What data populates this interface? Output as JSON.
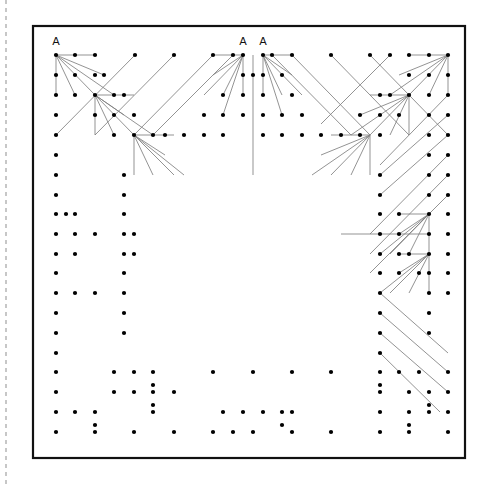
{
  "page": {
    "width": 498,
    "height": 484,
    "background": "#ffffff"
  },
  "colors": {
    "frame_stroke": "#111111",
    "dot_fill": "#000000",
    "connector_stroke": "#808080",
    "margin_line_stroke": "#9a9a9a",
    "label_fill": "#111111"
  },
  "frame": {
    "x": 33,
    "y": 26,
    "width": 432,
    "height": 432,
    "stroke_width": 2.2
  },
  "margin_line": {
    "x": 6,
    "y1": 0,
    "y2": 484,
    "dash": "4 4",
    "stroke_width": 1.1
  },
  "grid": {
    "origin_x": 56,
    "origin_y": 55,
    "step_x": 19.6,
    "step_y": 19.6,
    "cols": 21,
    "rows": 20,
    "dot_radius": 2.1
  },
  "labels": [
    {
      "text": "A",
      "x": 56,
      "y": 45,
      "name": "label-a-left"
    },
    {
      "text": "A",
      "x": 243,
      "y": 45,
      "name": "label-a-center-left"
    },
    {
      "text": "A",
      "x": 263,
      "y": 45,
      "name": "label-a-center-right"
    }
  ],
  "dots": [
    [
      56,
      55
    ],
    [
      75,
      55
    ],
    [
      95,
      55
    ],
    [
      135,
      55
    ],
    [
      174,
      55
    ],
    [
      213,
      55
    ],
    [
      233,
      55
    ],
    [
      243,
      55
    ],
    [
      263,
      55
    ],
    [
      272,
      55
    ],
    [
      292,
      55
    ],
    [
      331,
      55
    ],
    [
      370,
      55
    ],
    [
      390,
      55
    ],
    [
      409,
      55
    ],
    [
      429,
      55
    ],
    [
      448,
      55
    ],
    [
      56,
      75
    ],
    [
      75,
      75
    ],
    [
      95,
      75
    ],
    [
      104,
      75
    ],
    [
      243,
      75
    ],
    [
      253,
      75
    ],
    [
      263,
      75
    ],
    [
      282,
      75
    ],
    [
      409,
      75
    ],
    [
      429,
      75
    ],
    [
      448,
      75
    ],
    [
      56,
      95
    ],
    [
      75,
      95
    ],
    [
      95,
      95
    ],
    [
      114,
      95
    ],
    [
      124,
      95
    ],
    [
      223,
      95
    ],
    [
      243,
      95
    ],
    [
      263,
      95
    ],
    [
      292,
      95
    ],
    [
      380,
      95
    ],
    [
      390,
      95
    ],
    [
      409,
      95
    ],
    [
      429,
      95
    ],
    [
      448,
      95
    ],
    [
      56,
      115
    ],
    [
      95,
      115
    ],
    [
      114,
      115
    ],
    [
      134,
      115
    ],
    [
      204,
      115
    ],
    [
      223,
      115
    ],
    [
      243,
      115
    ],
    [
      263,
      115
    ],
    [
      282,
      115
    ],
    [
      302,
      115
    ],
    [
      360,
      115
    ],
    [
      380,
      115
    ],
    [
      399,
      115
    ],
    [
      429,
      115
    ],
    [
      448,
      115
    ],
    [
      56,
      135
    ],
    [
      114,
      135
    ],
    [
      134,
      135
    ],
    [
      153,
      135
    ],
    [
      165,
      135
    ],
    [
      184,
      135
    ],
    [
      204,
      135
    ],
    [
      223,
      135
    ],
    [
      263,
      135
    ],
    [
      282,
      135
    ],
    [
      302,
      135
    ],
    [
      321,
      135
    ],
    [
      341,
      135
    ],
    [
      360,
      135
    ],
    [
      380,
      135
    ],
    [
      429,
      135
    ],
    [
      448,
      135
    ],
    [
      56,
      155
    ],
    [
      429,
      155
    ],
    [
      448,
      155
    ],
    [
      56,
      175
    ],
    [
      124,
      175
    ],
    [
      380,
      175
    ],
    [
      429,
      175
    ],
    [
      448,
      175
    ],
    [
      56,
      195
    ],
    [
      124,
      195
    ],
    [
      380,
      195
    ],
    [
      429,
      195
    ],
    [
      448,
      195
    ],
    [
      56,
      214
    ],
    [
      66,
      214
    ],
    [
      75,
      214
    ],
    [
      124,
      214
    ],
    [
      380,
      214
    ],
    [
      399,
      214
    ],
    [
      429,
      214
    ],
    [
      448,
      214
    ],
    [
      56,
      234
    ],
    [
      75,
      234
    ],
    [
      95,
      234
    ],
    [
      124,
      234
    ],
    [
      134,
      234
    ],
    [
      380,
      234
    ],
    [
      399,
      234
    ],
    [
      429,
      234
    ],
    [
      448,
      234
    ],
    [
      56,
      254
    ],
    [
      75,
      254
    ],
    [
      124,
      254
    ],
    [
      134,
      254
    ],
    [
      380,
      254
    ],
    [
      399,
      254
    ],
    [
      409,
      254
    ],
    [
      429,
      254
    ],
    [
      448,
      254
    ],
    [
      56,
      273
    ],
    [
      124,
      273
    ],
    [
      380,
      273
    ],
    [
      399,
      273
    ],
    [
      419,
      273
    ],
    [
      429,
      273
    ],
    [
      448,
      273
    ],
    [
      56,
      293
    ],
    [
      75,
      293
    ],
    [
      95,
      293
    ],
    [
      124,
      293
    ],
    [
      380,
      293
    ],
    [
      429,
      293
    ],
    [
      448,
      293
    ],
    [
      56,
      313
    ],
    [
      124,
      313
    ],
    [
      380,
      313
    ],
    [
      429,
      313
    ],
    [
      56,
      333
    ],
    [
      124,
      333
    ],
    [
      380,
      333
    ],
    [
      429,
      333
    ],
    [
      56,
      353
    ],
    [
      380,
      353
    ],
    [
      56,
      372
    ],
    [
      114,
      372
    ],
    [
      134,
      372
    ],
    [
      153,
      372
    ],
    [
      213,
      372
    ],
    [
      253,
      372
    ],
    [
      292,
      372
    ],
    [
      331,
      372
    ],
    [
      380,
      372
    ],
    [
      399,
      372
    ],
    [
      419,
      372
    ],
    [
      448,
      372
    ],
    [
      153,
      385
    ],
    [
      380,
      385
    ],
    [
      56,
      392
    ],
    [
      114,
      392
    ],
    [
      134,
      392
    ],
    [
      153,
      392
    ],
    [
      174,
      392
    ],
    [
      380,
      392
    ],
    [
      409,
      392
    ],
    [
      429,
      392
    ],
    [
      448,
      392
    ],
    [
      153,
      405
    ],
    [
      429,
      405
    ],
    [
      56,
      412
    ],
    [
      75,
      412
    ],
    [
      95,
      412
    ],
    [
      153,
      412
    ],
    [
      223,
      412
    ],
    [
      243,
      412
    ],
    [
      263,
      412
    ],
    [
      282,
      412
    ],
    [
      292,
      412
    ],
    [
      380,
      412
    ],
    [
      409,
      412
    ],
    [
      429,
      412
    ],
    [
      448,
      412
    ],
    [
      95,
      425
    ],
    [
      282,
      425
    ],
    [
      409,
      425
    ],
    [
      56,
      432
    ],
    [
      95,
      432
    ],
    [
      134,
      432
    ],
    [
      174,
      432
    ],
    [
      213,
      432
    ],
    [
      233,
      432
    ],
    [
      253,
      432
    ],
    [
      292,
      432
    ],
    [
      331,
      432
    ],
    [
      380,
      432
    ],
    [
      409,
      432
    ],
    [
      448,
      432
    ]
  ],
  "connectors": [
    {
      "from": [
        56,
        55
      ],
      "to": [
        95,
        55
      ]
    },
    {
      "from": [
        56,
        55
      ],
      "to": [
        56,
        95
      ]
    },
    {
      "from": [
        56,
        55
      ],
      "to": [
        75,
        95
      ]
    },
    {
      "from": [
        56,
        55
      ],
      "to": [
        95,
        95
      ]
    },
    {
      "from": [
        56,
        55
      ],
      "to": [
        104,
        75
      ]
    },
    {
      "from": [
        56,
        55
      ],
      "to": [
        114,
        95
      ]
    },
    {
      "from": [
        95,
        95
      ],
      "to": [
        134,
        95
      ]
    },
    {
      "from": [
        95,
        95
      ],
      "to": [
        95,
        135
      ]
    },
    {
      "from": [
        95,
        95
      ],
      "to": [
        114,
        135
      ]
    },
    {
      "from": [
        95,
        95
      ],
      "to": [
        134,
        135
      ]
    },
    {
      "from": [
        95,
        95
      ],
      "to": [
        124,
        115
      ]
    },
    {
      "from": [
        95,
        95
      ],
      "to": [
        153,
        135
      ]
    },
    {
      "from": [
        134,
        135
      ],
      "to": [
        174,
        135
      ]
    },
    {
      "from": [
        134,
        135
      ],
      "to": [
        134,
        175
      ]
    },
    {
      "from": [
        134,
        135
      ],
      "to": [
        153,
        175
      ]
    },
    {
      "from": [
        134,
        135
      ],
      "to": [
        174,
        175
      ]
    },
    {
      "from": [
        134,
        135
      ],
      "to": [
        165,
        155
      ]
    },
    {
      "from": [
        134,
        135
      ],
      "to": [
        184,
        175
      ]
    },
    {
      "from": [
        448,
        55
      ],
      "to": [
        409,
        55
      ]
    },
    {
      "from": [
        448,
        55
      ],
      "to": [
        448,
        95
      ]
    },
    {
      "from": [
        448,
        55
      ],
      "to": [
        429,
        95
      ]
    },
    {
      "from": [
        448,
        55
      ],
      "to": [
        409,
        95
      ]
    },
    {
      "from": [
        448,
        55
      ],
      "to": [
        399,
        75
      ]
    },
    {
      "from": [
        448,
        55
      ],
      "to": [
        390,
        95
      ]
    },
    {
      "from": [
        409,
        95
      ],
      "to": [
        370,
        95
      ]
    },
    {
      "from": [
        409,
        95
      ],
      "to": [
        409,
        135
      ]
    },
    {
      "from": [
        409,
        95
      ],
      "to": [
        390,
        135
      ]
    },
    {
      "from": [
        409,
        95
      ],
      "to": [
        370,
        135
      ]
    },
    {
      "from": [
        409,
        95
      ],
      "to": [
        360,
        115
      ]
    },
    {
      "from": [
        409,
        95
      ],
      "to": [
        351,
        135
      ]
    },
    {
      "from": [
        370,
        135
      ],
      "to": [
        331,
        135
      ]
    },
    {
      "from": [
        370,
        135
      ],
      "to": [
        370,
        175
      ]
    },
    {
      "from": [
        370,
        135
      ],
      "to": [
        351,
        175
      ]
    },
    {
      "from": [
        370,
        135
      ],
      "to": [
        331,
        175
      ]
    },
    {
      "from": [
        370,
        135
      ],
      "to": [
        321,
        155
      ]
    },
    {
      "from": [
        370,
        135
      ],
      "to": [
        312,
        175
      ]
    },
    {
      "from": [
        243,
        55
      ],
      "to": [
        213,
        55
      ]
    },
    {
      "from": [
        243,
        55
      ],
      "to": [
        243,
        95
      ]
    },
    {
      "from": [
        243,
        55
      ],
      "to": [
        223,
        95
      ]
    },
    {
      "from": [
        243,
        55
      ],
      "to": [
        204,
        95
      ]
    },
    {
      "from": [
        243,
        55
      ],
      "to": [
        213,
        75
      ]
    },
    {
      "from": [
        243,
        55
      ],
      "to": [
        223,
        115
      ]
    },
    {
      "from": [
        263,
        55
      ],
      "to": [
        292,
        55
      ]
    },
    {
      "from": [
        263,
        55
      ],
      "to": [
        263,
        95
      ]
    },
    {
      "from": [
        263,
        55
      ],
      "to": [
        282,
        95
      ]
    },
    {
      "from": [
        263,
        55
      ],
      "to": [
        302,
        95
      ]
    },
    {
      "from": [
        263,
        55
      ],
      "to": [
        292,
        75
      ]
    },
    {
      "from": [
        263,
        55
      ],
      "to": [
        282,
        115
      ]
    },
    {
      "from": [
        253,
        55
      ],
      "to": [
        253,
        175
      ]
    },
    {
      "from": [
        429,
        214
      ],
      "to": [
        399,
        214
      ]
    },
    {
      "from": [
        429,
        214
      ],
      "to": [
        429,
        254
      ]
    },
    {
      "from": [
        429,
        214
      ],
      "to": [
        409,
        254
      ]
    },
    {
      "from": [
        429,
        214
      ],
      "to": [
        390,
        254
      ]
    },
    {
      "from": [
        429,
        214
      ],
      "to": [
        399,
        234
      ]
    },
    {
      "from": [
        429,
        214
      ],
      "to": [
        380,
        254
      ]
    },
    {
      "from": [
        429,
        254
      ],
      "to": [
        399,
        254
      ]
    },
    {
      "from": [
        429,
        254
      ],
      "to": [
        429,
        293
      ]
    },
    {
      "from": [
        429,
        254
      ],
      "to": [
        409,
        293
      ]
    },
    {
      "from": [
        429,
        254
      ],
      "to": [
        390,
        293
      ]
    },
    {
      "from": [
        429,
        254
      ],
      "to": [
        399,
        273
      ]
    },
    {
      "from": [
        429,
        254
      ],
      "to": [
        380,
        293
      ]
    },
    {
      "from": [
        429,
        234
      ],
      "to": [
        341,
        234
      ]
    },
    {
      "from": [
        135,
        55
      ],
      "to": [
        56,
        135
      ]
    },
    {
      "from": [
        174,
        55
      ],
      "to": [
        95,
        135
      ]
    },
    {
      "from": [
        213,
        55
      ],
      "to": [
        134,
        135
      ]
    },
    {
      "from": [
        233,
        55
      ],
      "to": [
        153,
        135
      ]
    },
    {
      "from": [
        272,
        55
      ],
      "to": [
        351,
        135
      ]
    },
    {
      "from": [
        292,
        55
      ],
      "to": [
        370,
        135
      ]
    },
    {
      "from": [
        331,
        55
      ],
      "to": [
        409,
        135
      ]
    },
    {
      "from": [
        370,
        55
      ],
      "to": [
        448,
        135
      ]
    },
    {
      "from": [
        390,
        55
      ],
      "to": [
        321,
        124
      ]
    },
    {
      "from": [
        448,
        95
      ],
      "to": [
        380,
        165
      ]
    },
    {
      "from": [
        448,
        155
      ],
      "to": [
        370,
        234
      ]
    },
    {
      "from": [
        448,
        175
      ],
      "to": [
        370,
        254
      ]
    },
    {
      "from": [
        448,
        195
      ],
      "to": [
        370,
        273
      ]
    },
    {
      "from": [
        380,
        175
      ],
      "to": [
        448,
        115
      ]
    },
    {
      "from": [
        380,
        195
      ],
      "to": [
        448,
        135
      ]
    },
    {
      "from": [
        380,
        293
      ],
      "to": [
        448,
        353
      ]
    },
    {
      "from": [
        380,
        313
      ],
      "to": [
        448,
        372
      ]
    },
    {
      "from": [
        380,
        333
      ],
      "to": [
        448,
        392
      ]
    },
    {
      "from": [
        380,
        353
      ],
      "to": [
        440,
        412
      ]
    }
  ]
}
